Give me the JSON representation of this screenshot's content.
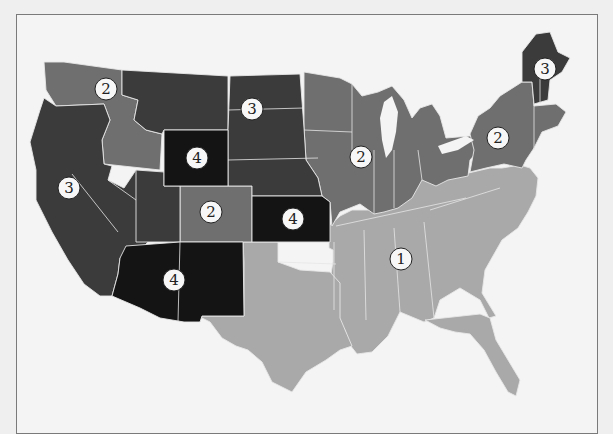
{
  "map": {
    "type": "choropleth",
    "subject": "United States regions",
    "colors": {
      "region_1": "#a9a9a9",
      "region_2": "#6f6f6f",
      "region_3": "#3b3b3b",
      "region_4": "#141414",
      "background": "#f4f4f4",
      "border": "#7a7a7a"
    },
    "labels": [
      {
        "id": "wa-label",
        "value": "2",
        "region": "Pacific Northwest (Washington)",
        "x": 106,
        "y": 89
      },
      {
        "id": "nd-label",
        "value": "3",
        "region": "Northern Plains (North/South Dakota)",
        "x": 252,
        "y": 109
      },
      {
        "id": "wy-label",
        "value": "4",
        "region": "Wyoming",
        "x": 197,
        "y": 158
      },
      {
        "id": "ca-label",
        "value": "3",
        "region": "California / Nevada / Oregon",
        "x": 69,
        "y": 188
      },
      {
        "id": "co-label",
        "value": "2",
        "region": "Colorado",
        "x": 211,
        "y": 212
      },
      {
        "id": "ks-label",
        "value": "4",
        "region": "Kansas",
        "x": 293,
        "y": 219
      },
      {
        "id": "nm-label",
        "value": "4",
        "region": "Arizona / New Mexico",
        "x": 174,
        "y": 280
      },
      {
        "id": "il-label",
        "value": "2",
        "region": "Midwest (Iowa/Wisconsin/Illinois)",
        "x": 361,
        "y": 157
      },
      {
        "id": "pa-label",
        "value": "2",
        "region": "Mid-Atlantic (New York/Pennsylvania)",
        "x": 498,
        "y": 138
      },
      {
        "id": "me-label",
        "value": "3",
        "region": "Northern New England (Maine/NH/VT)",
        "x": 545,
        "y": 69
      },
      {
        "id": "se-label",
        "value": "1",
        "region": "South / Southeast",
        "x": 401,
        "y": 259
      }
    ]
  }
}
